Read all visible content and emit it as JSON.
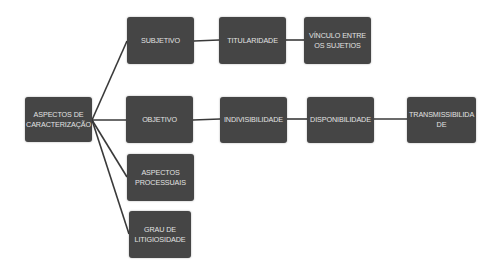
{
  "diagram": {
    "type": "tree",
    "colors": {
      "node_fill": "#454545",
      "node_text": "#e2e2e2",
      "connector": "#3a3a3a",
      "background": "#ffffff"
    },
    "root": {
      "label": "ASPECTOS DE CARACTERIZAÇÃO"
    },
    "nodes": {
      "subjetivo": {
        "label": "SUBJETIVO"
      },
      "titularidade": {
        "label": "TITULARIDADE"
      },
      "vinculo": {
        "label": "VÍNCULO ENTRE OS SUJETIOS"
      },
      "objetivo": {
        "label": "OBJETIVO"
      },
      "indivisibilidade": {
        "label": "INDIVISIBILIDADE"
      },
      "disponibilidade": {
        "label": "DISPONIBILIDADE"
      },
      "transmissibilidade": {
        "label": "TRANSMISSIBILIDA DE"
      },
      "processuais": {
        "label": "ASPECTOS PROCESSUAIS"
      },
      "litigiosidade": {
        "label": "GRAU DE LITIGIOSIDADE"
      }
    },
    "edges": [
      [
        "root",
        "subjetivo"
      ],
      [
        "root",
        "objetivo"
      ],
      [
        "root",
        "processuais"
      ],
      [
        "root",
        "litigiosidade"
      ],
      [
        "subjetivo",
        "titularidade"
      ],
      [
        "titularidade",
        "vinculo"
      ],
      [
        "objetivo",
        "indivisibilidade"
      ],
      [
        "indivisibilidade",
        "disponibilidade"
      ],
      [
        "disponibilidade",
        "transmissibilidade"
      ]
    ]
  }
}
